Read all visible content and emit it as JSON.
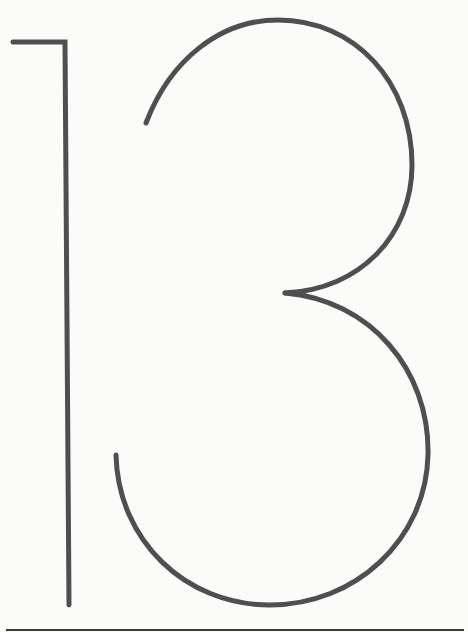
{
  "figure": {
    "depicted_text": "13",
    "stroke_color": "#4f4f4f",
    "background_color": "#fbfbfa",
    "rule_color": "#3a3a3a"
  }
}
